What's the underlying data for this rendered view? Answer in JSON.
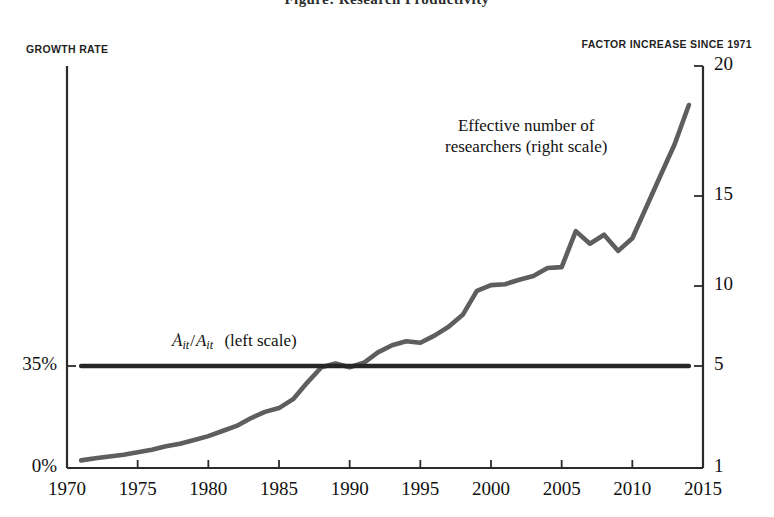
{
  "title": "Figure: Research Productivity",
  "axis_captions": {
    "left": "GROWTH RATE",
    "right": "FACTOR INCREASE SINCE 1971"
  },
  "annotations": {
    "researchers_line1": "Effective number of",
    "researchers_line2": "researchers (right scale)",
    "growth_A": "A",
    "growth_sub1": "it",
    "growth_slash": "/",
    "growth_A2": "A",
    "growth_sub2": "it",
    "growth_scale": "(left scale)"
  },
  "colors": {
    "axis": "#2b2b2b",
    "flat_line": "#262626",
    "curve": "#5e5e5e",
    "text": "#111111"
  },
  "chart_data": {
    "type": "line",
    "title": "",
    "xlabel": "",
    "ylabel": "GROWTH RATE",
    "y2label": "FACTOR INCREASE SINCE 1971",
    "grid": false,
    "legend": "inline-annotations",
    "xlim": [
      1970,
      2015
    ],
    "xticks": [
      1970,
      1975,
      1980,
      1985,
      1990,
      1995,
      2000,
      2005,
      2010,
      2015
    ],
    "xticklabels": [
      "1970",
      "1975",
      "1980",
      "1985",
      "1990",
      "1995",
      "2000",
      "2005",
      "2010",
      "2015"
    ],
    "ylim_left": [
      0,
      48
    ],
    "yticks_left": [
      0,
      35
    ],
    "yticklabels_left": [
      "0%",
      "35%"
    ],
    "ylim_right": [
      1,
      20
    ],
    "yticks_right": [
      1,
      5,
      10,
      15,
      20
    ],
    "yticklabels_right": [
      "1",
      "5",
      "10",
      "15",
      "20"
    ],
    "series": [
      {
        "name": "Effective number of researchers (right scale)",
        "axis": "right",
        "color": "#5e5e5e",
        "x": [
          1971,
          1972,
          1973,
          1974,
          1975,
          1976,
          1977,
          1978,
          1979,
          1980,
          1981,
          1982,
          1983,
          1984,
          1985,
          1986,
          1987,
          1988,
          1989,
          1990,
          1991,
          1992,
          1993,
          1994,
          1995,
          1996,
          1997,
          1998,
          1999,
          2000,
          2001,
          2002,
          2003,
          2004,
          2005,
          2006,
          2007,
          2008,
          2009,
          2010,
          2011,
          2012,
          2013,
          2014
        ],
        "values": [
          1.3,
          1.38,
          1.45,
          1.52,
          1.62,
          1.72,
          1.85,
          1.95,
          2.1,
          2.25,
          2.45,
          2.65,
          2.95,
          3.2,
          3.35,
          3.7,
          4.35,
          4.95,
          5.15,
          4.95,
          5.2,
          5.85,
          6.3,
          6.55,
          6.45,
          6.9,
          7.45,
          8.2,
          9.7,
          10.05,
          10.1,
          10.35,
          10.55,
          11.0,
          11.05,
          13.05,
          12.35,
          12.85,
          11.95,
          12.65,
          14.4,
          15.8,
          17.0,
          18.5
        ]
      },
      {
        "name": "Ȧit/Ait (left scale)",
        "axis": "left",
        "color": "#262626",
        "x": [
          1971,
          2014
        ],
        "values": [
          35,
          35
        ],
        "note": "constant 35% growth rate, aligns with right-axis value 5"
      }
    ]
  }
}
